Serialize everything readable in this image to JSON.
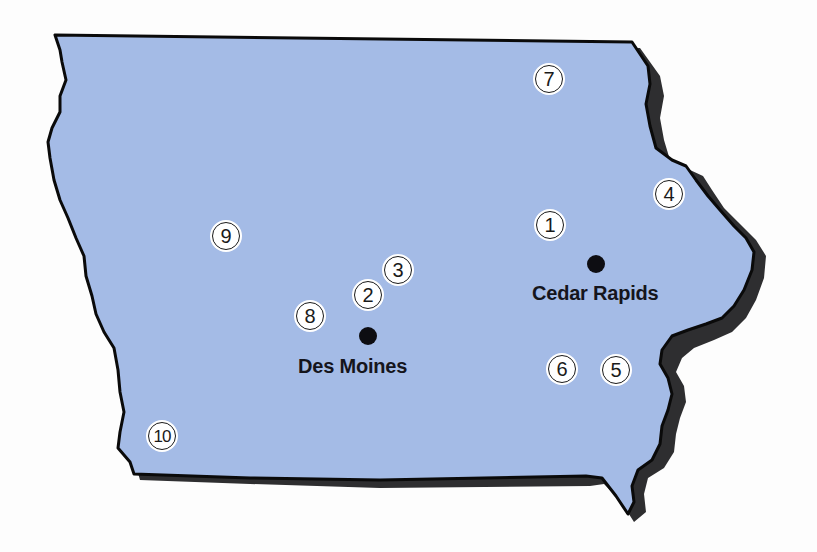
{
  "map": {
    "region": "Iowa",
    "colors": {
      "state_fill": "#a4bbe6",
      "state_outline": "#0a0a0a",
      "shadow": "#2e2e30",
      "background": "#fdfdfd",
      "marker_fill": "#ffffff",
      "city_dot": "#0d0d12"
    },
    "cities": [
      {
        "name": "Des Moines",
        "dot": {
          "x": 368,
          "y": 336
        },
        "label": {
          "x": 298,
          "y": 355
        }
      },
      {
        "name": "Cedar Rapids",
        "dot": {
          "x": 596,
          "y": 264
        },
        "label": {
          "x": 532,
          "y": 282
        }
      }
    ],
    "markers": [
      {
        "label": "1",
        "x": 550,
        "y": 225
      },
      {
        "label": "2",
        "x": 368,
        "y": 295
      },
      {
        "label": "3",
        "x": 398,
        "y": 270
      },
      {
        "label": "4",
        "x": 669,
        "y": 194
      },
      {
        "label": "5",
        "x": 616,
        "y": 370
      },
      {
        "label": "6",
        "x": 562,
        "y": 369
      },
      {
        "label": "7",
        "x": 549,
        "y": 79
      },
      {
        "label": "8",
        "x": 310,
        "y": 316
      },
      {
        "label": "9",
        "x": 226,
        "y": 236
      },
      {
        "label": "10",
        "x": 162,
        "y": 436
      }
    ]
  }
}
